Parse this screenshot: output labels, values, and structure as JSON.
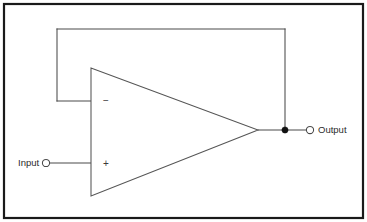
{
  "diagram": {
    "background_color": "#ffffff",
    "border_color": "#1a1a1a",
    "wire_color": "#4a4a4a",
    "junction_color": "#111111",
    "labels": {
      "input": "Input",
      "output": "Output",
      "inverting": "−",
      "non_inverting": "+"
    },
    "components": {
      "amplifier": {
        "name": "operational amplifier",
        "shape": "triangle",
        "points": "91,68 91,196 258,130"
      },
      "input_terminal": {
        "cx": 46,
        "cy": 163,
        "r": 3.6
      },
      "output_terminal": {
        "cx": 310,
        "cy": 130,
        "r": 3.6
      },
      "feedback_junction": {
        "cx": 285,
        "cy": 130,
        "r": 3.1
      }
    },
    "wires": {
      "input_lead": "M46,163 L91,163",
      "output_lead": "M258,130 L310,130",
      "feedback_vertical_right": "M285,130 L285,29",
      "feedback_horizontal_top": "M285,29 L57,29",
      "feedback_vertical_left": "M57,29 L57,101",
      "feedback_horizontal_bottom": "M57,101 L91,101"
    },
    "frame": {
      "x": 4,
      "y": 4,
      "width": 359,
      "height": 214
    }
  }
}
